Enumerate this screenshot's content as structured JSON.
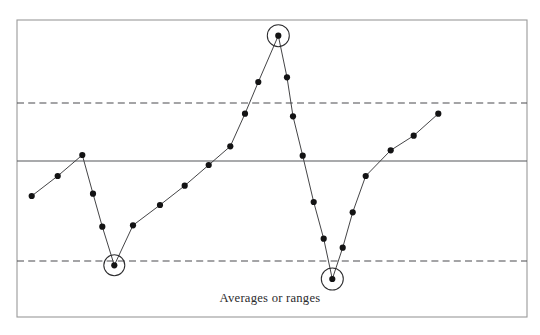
{
  "chart_data": {
    "type": "line",
    "title": "",
    "subtitle": "",
    "xlabel": "Averages or ranges",
    "ylabel": "",
    "grid": false,
    "legend": null,
    "legend_position": "none",
    "xlim": [
      0,
      27
    ],
    "ylim": [
      0,
      100
    ],
    "axis_ticks_visible": false,
    "series": [
      {
        "name": "Averages or ranges",
        "x": [
          1,
          2,
          3,
          4,
          5,
          6,
          7,
          8,
          9,
          10,
          11,
          12,
          13,
          14,
          15,
          16,
          17,
          18,
          19,
          20,
          21,
          22,
          23,
          24,
          25,
          26
        ],
        "values": [
          40.6,
          47.4,
          54.7,
          41.8,
          30.5,
          17.8,
          31.1,
          37.9,
          44.6,
          51.4,
          58.0,
          69.4,
          80.1,
          96.4,
          78.0,
          64.6,
          51.8,
          36.5,
          23.8,
          10.1,
          20.9,
          33.1,
          45.5,
          54.4,
          59.5,
          67.3
        ]
      }
    ],
    "reference_lines": [
      {
        "name": "upper-control-limit",
        "value": 79.7,
        "style": "dashed"
      },
      {
        "name": "center-line",
        "value": 59.2,
        "style": "solid"
      },
      {
        "name": "lower-control-limit",
        "value": 19.2,
        "style": "dashed"
      }
    ],
    "highlighted_points": [
      {
        "index": 6,
        "x": 6,
        "value": 17.8,
        "reason": "below-lower-control-limit"
      },
      {
        "index": 14,
        "x": 14,
        "value": 96.4,
        "reason": "above-upper-control-limit"
      },
      {
        "index": 20,
        "x": 20,
        "value": 10.1,
        "reason": "below-lower-control-limit"
      }
    ],
    "point_pixels": [
      [
        31.7,
        196.0
      ],
      [
        57.7,
        176.0
      ],
      [
        82.3,
        155.0
      ],
      [
        93.0,
        193.7
      ],
      [
        102.3,
        226.7
      ],
      [
        114.3,
        265.3
      ],
      [
        133.0,
        225.3
      ],
      [
        160.0,
        205.0
      ],
      [
        184.7,
        185.7
      ],
      [
        208.7,
        165.0
      ],
      [
        230.3,
        146.3
      ],
      [
        245.0,
        113.7
      ],
      [
        258.3,
        82.0
      ],
      [
        278.3,
        35.7
      ],
      [
        287.0,
        77.3
      ],
      [
        293.0,
        116.3
      ],
      [
        302.7,
        155.7
      ],
      [
        313.7,
        202.0
      ],
      [
        323.7,
        238.7
      ],
      [
        332.3,
        279.0
      ],
      [
        342.7,
        247.7
      ],
      [
        352.7,
        212.3
      ],
      [
        365.7,
        176.0
      ],
      [
        390.7,
        150.3
      ],
      [
        413.7,
        135.7
      ],
      [
        438.3,
        113.7
      ]
    ],
    "highlight_pixels": [
      [
        114.3,
        265.3,
        10.5
      ],
      [
        278.3,
        35.7,
        11.0
      ],
      [
        332.3,
        279.0,
        11.0
      ]
    ],
    "reference_pixels": {
      "upper_limit_y": 103.0,
      "center_y": 161.0,
      "lower_limit_y": 261.0
    },
    "frame_pixels": {
      "x": 17,
      "y": 20,
      "width": 510,
      "height": 297
    },
    "caption_pixel": {
      "x": 270,
      "y": 302
    },
    "colors": {
      "background": "#ffffff",
      "frame_border": "#9a9a9a",
      "center_line": "#55565a",
      "limit_line": "#4a4b4f",
      "series_line": "#3a3a3c",
      "point_fill": "#131314",
      "highlight_ring": "#2c2c2e",
      "caption_text": "#2b2b2d"
    }
  }
}
